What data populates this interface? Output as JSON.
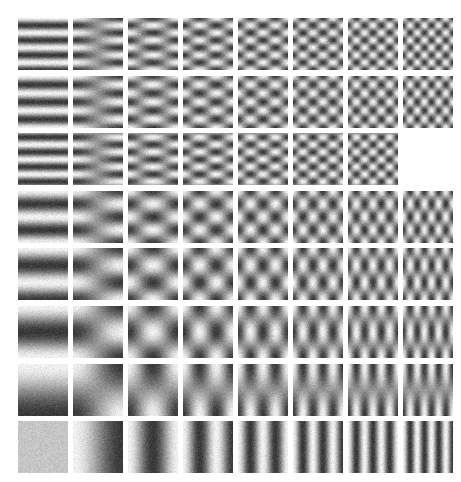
{
  "figure": {
    "type": "basis-function-grid",
    "background_color": "#ffffff",
    "width": 461,
    "height": 482
  },
  "layout": {
    "rows": 8,
    "cols": 8,
    "origin_x": 18,
    "origin_y": 18,
    "tile_width": 50,
    "tile_height": 52,
    "pitch_x": 55,
    "pitch_y": 57.6,
    "missing_tiles": [
      [
        2,
        7
      ]
    ]
  },
  "render": {
    "noise_amplitude": 26,
    "gamma": 1.0,
    "low_value": 18,
    "high_value": 242,
    "mid_value": 150,
    "smoothing": 0.9,
    "supersample": 2
  },
  "chart_data": {
    "type": "heatmap",
    "xlabel": "horizontal frequency index (u)",
    "ylabel": "vertical frequency index (v)",
    "grid_rows": 8,
    "grid_cols": 8,
    "u_values": [
      0,
      1,
      2,
      3,
      4,
      5,
      6,
      7
    ],
    "v_values": [
      7,
      6,
      5,
      4,
      3,
      3,
      2,
      0
    ],
    "tiles": [
      {
        "row": 0,
        "col": 0,
        "u": 0,
        "v": 7,
        "amp": 1.0,
        "phase_u": 0.0,
        "phase_v": 0.0
      },
      {
        "row": 0,
        "col": 1,
        "u": 1,
        "v": 7,
        "amp": 1.0,
        "phase_u": 0.0,
        "phase_v": 0.0
      },
      {
        "row": 0,
        "col": 2,
        "u": 2,
        "v": 7,
        "amp": 1.0,
        "phase_u": 0.0,
        "phase_v": 0.0
      },
      {
        "row": 0,
        "col": 3,
        "u": 3,
        "v": 7,
        "amp": 1.0,
        "phase_u": 0.0,
        "phase_v": 0.0
      },
      {
        "row": 0,
        "col": 4,
        "u": 4,
        "v": 7,
        "amp": 1.0,
        "phase_u": 0.0,
        "phase_v": 0.0
      },
      {
        "row": 0,
        "col": 5,
        "u": 5,
        "v": 7,
        "amp": 1.0,
        "phase_u": 0.0,
        "phase_v": 0.0
      },
      {
        "row": 0,
        "col": 6,
        "u": 6,
        "v": 7,
        "amp": 1.0,
        "phase_u": 0.0,
        "phase_v": 0.0
      },
      {
        "row": 0,
        "col": 7,
        "u": 7,
        "v": 7,
        "amp": 1.0,
        "phase_u": 0.0,
        "phase_v": 0.0
      },
      {
        "row": 1,
        "col": 0,
        "u": 0,
        "v": 6,
        "amp": 1.0,
        "phase_u": 0.0,
        "phase_v": 0.0
      },
      {
        "row": 1,
        "col": 1,
        "u": 1,
        "v": 6,
        "amp": 1.0,
        "phase_u": 0.0,
        "phase_v": 0.0
      },
      {
        "row": 1,
        "col": 2,
        "u": 2,
        "v": 6,
        "amp": 1.0,
        "phase_u": 0.0,
        "phase_v": 0.0
      },
      {
        "row": 1,
        "col": 3,
        "u": 3,
        "v": 6,
        "amp": 1.0,
        "phase_u": 0.0,
        "phase_v": 0.0
      },
      {
        "row": 1,
        "col": 4,
        "u": 4,
        "v": 6,
        "amp": 1.0,
        "phase_u": 0.0,
        "phase_v": 0.0
      },
      {
        "row": 1,
        "col": 5,
        "u": 5,
        "v": 6,
        "amp": 1.0,
        "phase_u": 0.0,
        "phase_v": 0.0
      },
      {
        "row": 1,
        "col": 6,
        "u": 6,
        "v": 6,
        "amp": 1.0,
        "phase_u": 0.0,
        "phase_v": 0.0
      },
      {
        "row": 1,
        "col": 7,
        "u": 7,
        "v": 6,
        "amp": 1.0,
        "phase_u": 0.0,
        "phase_v": 0.0
      },
      {
        "row": 2,
        "col": 0,
        "u": 0,
        "v": 7,
        "amp": 1.0,
        "phase_u": 0.0,
        "phase_v": 0.5
      },
      {
        "row": 2,
        "col": 1,
        "u": 1,
        "v": 7,
        "amp": 1.0,
        "phase_u": 0.0,
        "phase_v": 0.5
      },
      {
        "row": 2,
        "col": 2,
        "u": 2,
        "v": 7,
        "amp": 1.0,
        "phase_u": 0.0,
        "phase_v": 0.5
      },
      {
        "row": 2,
        "col": 3,
        "u": 3,
        "v": 7,
        "amp": 1.0,
        "phase_u": 0.0,
        "phase_v": 0.5
      },
      {
        "row": 2,
        "col": 4,
        "u": 4,
        "v": 7,
        "amp": 1.0,
        "phase_u": 0.0,
        "phase_v": 0.5
      },
      {
        "row": 2,
        "col": 5,
        "u": 5,
        "v": 7,
        "amp": 1.0,
        "phase_u": 0.0,
        "phase_v": 0.5
      },
      {
        "row": 2,
        "col": 6,
        "u": 6,
        "v": 7,
        "amp": 1.0,
        "phase_u": 0.0,
        "phase_v": 0.5
      },
      {
        "row": 3,
        "col": 0,
        "u": 0,
        "v": 4,
        "amp": 1.0,
        "phase_u": 0.0,
        "phase_v": 0.0
      },
      {
        "row": 3,
        "col": 1,
        "u": 1,
        "v": 4,
        "amp": 1.0,
        "phase_u": 0.0,
        "phase_v": 0.0
      },
      {
        "row": 3,
        "col": 2,
        "u": 2,
        "v": 4,
        "amp": 1.0,
        "phase_u": 0.0,
        "phase_v": 0.0
      },
      {
        "row": 3,
        "col": 3,
        "u": 3,
        "v": 4,
        "amp": 1.0,
        "phase_u": 0.0,
        "phase_v": 0.0
      },
      {
        "row": 3,
        "col": 4,
        "u": 4,
        "v": 4,
        "amp": 1.0,
        "phase_u": 0.0,
        "phase_v": 0.0
      },
      {
        "row": 3,
        "col": 5,
        "u": 5,
        "v": 4,
        "amp": 1.0,
        "phase_u": 0.0,
        "phase_v": 0.0
      },
      {
        "row": 3,
        "col": 6,
        "u": 6,
        "v": 4,
        "amp": 1.0,
        "phase_u": 0.0,
        "phase_v": 0.0
      },
      {
        "row": 3,
        "col": 7,
        "u": 7,
        "v": 4,
        "amp": 1.0,
        "phase_u": 0.0,
        "phase_v": 0.0
      },
      {
        "row": 4,
        "col": 0,
        "u": 0,
        "v": 3,
        "amp": 1.0,
        "phase_u": 0.0,
        "phase_v": 0.0
      },
      {
        "row": 4,
        "col": 1,
        "u": 1,
        "v": 3,
        "amp": 1.0,
        "phase_u": 0.0,
        "phase_v": 0.0
      },
      {
        "row": 4,
        "col": 2,
        "u": 2,
        "v": 3,
        "amp": 1.0,
        "phase_u": 0.0,
        "phase_v": 0.0
      },
      {
        "row": 4,
        "col": 3,
        "u": 3,
        "v": 3,
        "amp": 1.0,
        "phase_u": 0.0,
        "phase_v": 0.0
      },
      {
        "row": 4,
        "col": 4,
        "u": 4,
        "v": 3,
        "amp": 1.0,
        "phase_u": 0.0,
        "phase_v": 0.0
      },
      {
        "row": 4,
        "col": 5,
        "u": 5,
        "v": 3,
        "amp": 1.0,
        "phase_u": 0.0,
        "phase_v": 0.0
      },
      {
        "row": 4,
        "col": 6,
        "u": 6,
        "v": 3,
        "amp": 1.0,
        "phase_u": 0.0,
        "phase_v": 0.0
      },
      {
        "row": 4,
        "col": 7,
        "u": 7,
        "v": 3,
        "amp": 1.0,
        "phase_u": 0.0,
        "phase_v": 0.0
      },
      {
        "row": 5,
        "col": 0,
        "u": 0,
        "v": 2,
        "amp": 1.0,
        "phase_u": 0.0,
        "phase_v": 0.0
      },
      {
        "row": 5,
        "col": 1,
        "u": 1,
        "v": 2,
        "amp": 1.0,
        "phase_u": 0.0,
        "phase_v": 0.0
      },
      {
        "row": 5,
        "col": 2,
        "u": 2,
        "v": 2,
        "amp": 1.0,
        "phase_u": 0.0,
        "phase_v": 0.0
      },
      {
        "row": 5,
        "col": 3,
        "u": 3,
        "v": 2,
        "amp": 1.0,
        "phase_u": 0.0,
        "phase_v": 0.0
      },
      {
        "row": 5,
        "col": 4,
        "u": 4,
        "v": 2,
        "amp": 1.0,
        "phase_u": 0.0,
        "phase_v": 0.0
      },
      {
        "row": 5,
        "col": 5,
        "u": 5,
        "v": 2,
        "amp": 1.0,
        "phase_u": 0.0,
        "phase_v": 0.0
      },
      {
        "row": 5,
        "col": 6,
        "u": 6,
        "v": 2,
        "amp": 1.0,
        "phase_u": 0.0,
        "phase_v": 0.0
      },
      {
        "row": 5,
        "col": 7,
        "u": 7,
        "v": 2,
        "amp": 1.0,
        "phase_u": 0.0,
        "phase_v": 0.0
      },
      {
        "row": 6,
        "col": 0,
        "u": 0,
        "v": 1,
        "amp": 1.0,
        "phase_u": 0.0,
        "phase_v": 0.0
      },
      {
        "row": 6,
        "col": 1,
        "u": 1,
        "v": 1,
        "amp": 1.0,
        "phase_u": 0.0,
        "phase_v": 0.0
      },
      {
        "row": 6,
        "col": 2,
        "u": 2,
        "v": 1,
        "amp": 1.0,
        "phase_u": 0.0,
        "phase_v": 0.0
      },
      {
        "row": 6,
        "col": 3,
        "u": 3,
        "v": 1,
        "amp": 1.0,
        "phase_u": 0.0,
        "phase_v": 0.0
      },
      {
        "row": 6,
        "col": 4,
        "u": 4,
        "v": 1,
        "amp": 1.0,
        "phase_u": 0.0,
        "phase_v": 0.0
      },
      {
        "row": 6,
        "col": 5,
        "u": 5,
        "v": 1,
        "amp": 1.0,
        "phase_u": 0.0,
        "phase_v": 0.0
      },
      {
        "row": 6,
        "col": 6,
        "u": 6,
        "v": 1,
        "amp": 1.0,
        "phase_u": 0.0,
        "phase_v": 0.0
      },
      {
        "row": 6,
        "col": 7,
        "u": 7,
        "v": 1,
        "amp": 1.0,
        "phase_u": 0.0,
        "phase_v": 0.0
      },
      {
        "row": 7,
        "col": 0,
        "u": 0,
        "v": 0,
        "amp": 1.0,
        "phase_u": 0.0,
        "phase_v": 0.0
      },
      {
        "row": 7,
        "col": 1,
        "u": 1,
        "v": 0,
        "amp": 1.0,
        "phase_u": 0.0,
        "phase_v": 0.0
      },
      {
        "row": 7,
        "col": 2,
        "u": 2,
        "v": 0,
        "amp": 1.0,
        "phase_u": 0.0,
        "phase_v": 0.0
      },
      {
        "row": 7,
        "col": 3,
        "u": 3,
        "v": 0,
        "amp": 1.0,
        "phase_u": 0.0,
        "phase_v": 0.0
      },
      {
        "row": 7,
        "col": 4,
        "u": 4,
        "v": 0,
        "amp": 1.0,
        "phase_u": 0.0,
        "phase_v": 0.0
      },
      {
        "row": 7,
        "col": 5,
        "u": 5,
        "v": 0,
        "amp": 1.0,
        "phase_u": 0.0,
        "phase_v": 0.0
      },
      {
        "row": 7,
        "col": 6,
        "u": 6,
        "v": 0,
        "amp": 1.0,
        "phase_u": 0.0,
        "phase_v": 0.0
      },
      {
        "row": 7,
        "col": 7,
        "u": 7,
        "v": 0,
        "amp": 1.0,
        "phase_u": 0.0,
        "phase_v": 0.0
      }
    ]
  }
}
